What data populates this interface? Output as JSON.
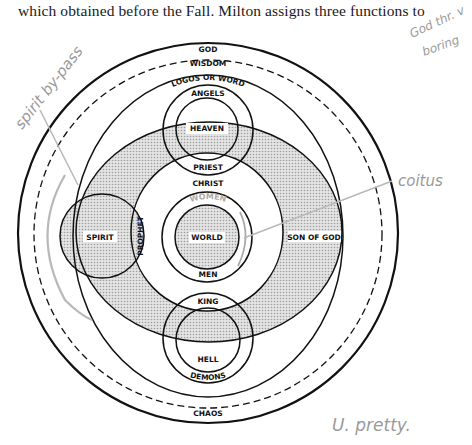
{
  "document": {
    "text_line": "which obtained before the Fall. Milton assigns three functions to"
  },
  "diagram": {
    "outer_labels": {
      "god": "GOD",
      "wisdom": "WISDOM",
      "logos": "LOGOS OR WORD",
      "chaos": "CHAOS"
    },
    "top_group": {
      "angels": "ANGELS",
      "heaven": "HEAVEN",
      "priest": "PRIEST"
    },
    "center_group": {
      "christ": "CHRIST",
      "women": "WOMEN",
      "world": "WORLD",
      "men": "MEN"
    },
    "bottom_group": {
      "king": "KING",
      "hell": "HELL",
      "demons": "DEMONS"
    },
    "side_labels": {
      "spirit": "SPIRIT",
      "prophet": "PROPHET",
      "son_of_god": "SON OF GOD"
    },
    "colors": {
      "line": "#111111",
      "shade": "#d4d4d4",
      "annotation": "#9a9a9a"
    }
  },
  "annotations": {
    "spirit_bypass": "spirit by-pass",
    "coitus": "coitus",
    "top_right": "God thr. v boring",
    "top_right_line1": "God thr. v",
    "top_right_line2": "boring",
    "bottom_right": "U. pretty."
  }
}
